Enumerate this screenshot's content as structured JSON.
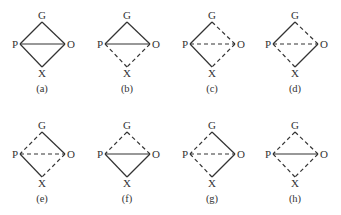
{
  "diagrams": [
    {
      "caption": "(a)",
      "cx": 42,
      "cy": 0,
      "edges": {
        "GP": "solid",
        "GO": "solid",
        "PO": "solid",
        "PX": "solid",
        "OX": "solid"
      }
    },
    {
      "caption": "(b)",
      "cx": 127,
      "cy": 0,
      "edges": {
        "GP": "solid",
        "GO": "solid",
        "PO": "solid",
        "PX": "dashed",
        "OX": "dashed"
      }
    },
    {
      "caption": "(c)",
      "cx": 212,
      "cy": 0,
      "edges": {
        "GP": "solid",
        "GO": "dashed",
        "PO": "dashed",
        "PX": "solid",
        "OX": "dashed"
      }
    },
    {
      "caption": "(d)",
      "cx": 295,
      "cy": 0,
      "edges": {
        "GP": "solid",
        "GO": "dashed",
        "PO": "dashed",
        "PX": "dashed",
        "OX": "solid"
      }
    },
    {
      "caption": "(e)",
      "cx": 42,
      "cy": 110,
      "edges": {
        "GP": "dashed",
        "GO": "solid",
        "PO": "dashed",
        "PX": "solid",
        "OX": "dashed"
      }
    },
    {
      "caption": "(f)",
      "cx": 127,
      "cy": 110,
      "edges": {
        "GP": "dashed",
        "GO": "dashed",
        "PO": "solid",
        "PX": "solid",
        "OX": "solid"
      }
    },
    {
      "caption": "(g)",
      "cx": 212,
      "cy": 110,
      "edges": {
        "GP": "dashed",
        "GO": "solid",
        "PO": "dashed",
        "PX": "dashed",
        "OX": "solid"
      }
    },
    {
      "caption": "(h)",
      "cx": 295,
      "cy": 110,
      "edges": {
        "GP": "dashed",
        "GO": "dashed",
        "PO": "solid",
        "PX": "dashed",
        "OX": "dashed"
      }
    }
  ],
  "node_labels": {
    "G": "G",
    "P": "P",
    "O": "O",
    "X": "X"
  },
  "colors": {
    "stroke": "#333333",
    "background": "#ffffff"
  }
}
